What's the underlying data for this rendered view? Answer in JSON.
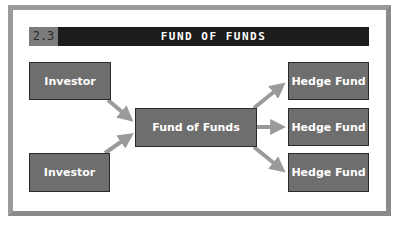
{
  "figure": {
    "number": "2.3",
    "title": "FUND OF FUNDS"
  },
  "nodes": {
    "investor_1": "Investor",
    "investor_2": "Investor",
    "fund_of_funds": "Fund of Funds",
    "hedge_fund_1": "Hedge Fund",
    "hedge_fund_2": "Hedge Fund",
    "hedge_fund_3": "Hedge Fund"
  },
  "edges": [
    {
      "from": "investor_1",
      "to": "fund_of_funds"
    },
    {
      "from": "investor_2",
      "to": "fund_of_funds"
    },
    {
      "from": "fund_of_funds",
      "to": "hedge_fund_1"
    },
    {
      "from": "fund_of_funds",
      "to": "hedge_fund_2"
    },
    {
      "from": "fund_of_funds",
      "to": "hedge_fund_3"
    }
  ],
  "colors": {
    "box_fill": "#6e6e6e",
    "arrow": "#9a9a9a",
    "title_bar": "#1c1c1c",
    "number_tab": "#7c7c7c"
  }
}
